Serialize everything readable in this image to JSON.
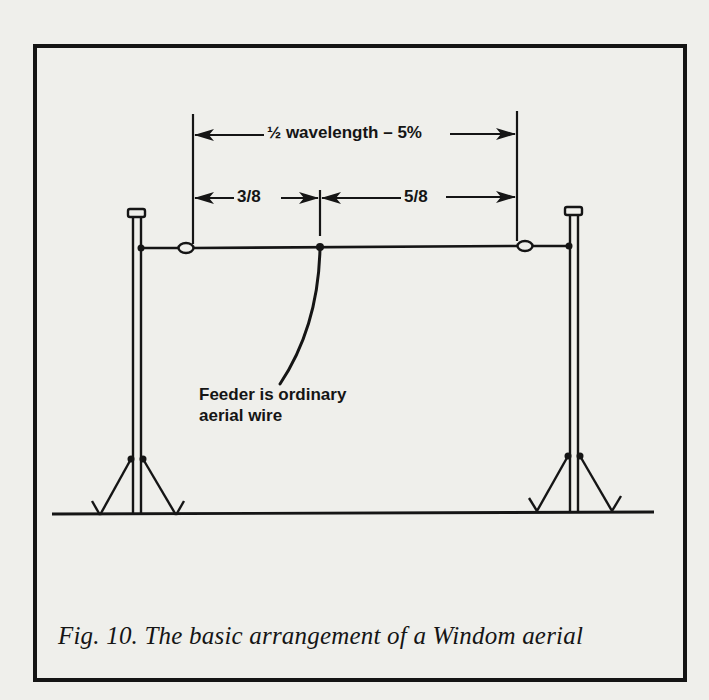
{
  "figure": {
    "caption": "Fig. 10. The basic arrangement of a Windom aerial",
    "title": "The basic arrangement of a Windom aerial",
    "number": "Fig. 10."
  },
  "dimensions": {
    "overall": "½ wavelength – 5%",
    "left_segment": "3/8",
    "right_segment": "5/8"
  },
  "annotations": {
    "feeder_line1": "Feeder is ordinary",
    "feeder_line2": "aerial wire"
  },
  "components": {
    "left_mast": "mast",
    "right_mast": "mast",
    "left_insulator": "insulator",
    "right_insulator": "insulator",
    "feed_point": "feed-point",
    "ground": "ground-line"
  },
  "colors": {
    "background": "#efefeb",
    "ink": "#151515"
  }
}
